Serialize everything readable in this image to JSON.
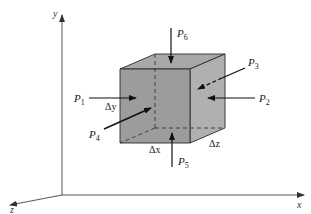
{
  "figure": {
    "type": "3D element free-body diagram",
    "colors": {
      "face_front": "#9a9a9a",
      "face_top": "#a9a9a9",
      "face_side": "#b0b0b0",
      "edge": "#2a2a2a",
      "axis": "#555555",
      "arrow": "#111111"
    }
  },
  "axes": {
    "x": {
      "label": "x"
    },
    "y": {
      "label": "y"
    },
    "z": {
      "label": "z"
    }
  },
  "forces": [
    {
      "id": "P1",
      "base": "P",
      "sub": "1",
      "direction": "into left face (+x)"
    },
    {
      "id": "P2",
      "base": "P",
      "sub": "2",
      "direction": "into right face (-x)"
    },
    {
      "id": "P3",
      "base": "P",
      "sub": "3",
      "direction": "into back face (+z)"
    },
    {
      "id": "P4",
      "base": "P",
      "sub": "4",
      "direction": "into front face (-z)"
    },
    {
      "id": "P5",
      "base": "P",
      "sub": "5",
      "direction": "into bottom face (+y)"
    },
    {
      "id": "P6",
      "base": "P",
      "sub": "6",
      "direction": "into top face (-y)"
    }
  ],
  "dimensions": {
    "dx": "Δx",
    "dy": "Δy",
    "dz": "Δz"
  }
}
